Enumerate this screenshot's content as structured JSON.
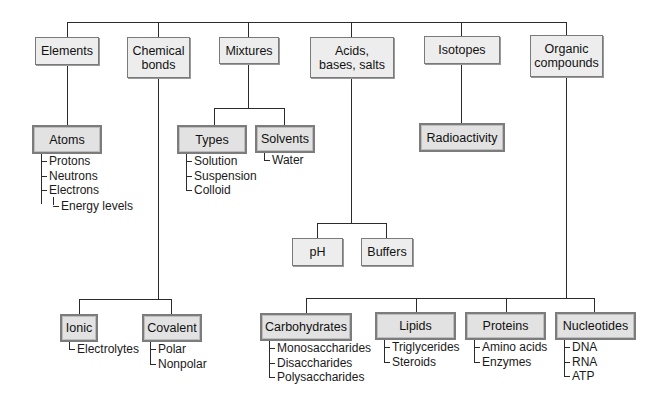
{
  "diagram": {
    "top_level": [
      {
        "label": "Elements"
      },
      {
        "label": "Chemical bonds"
      },
      {
        "label": "Mixtures"
      },
      {
        "label": "Acids, bases, salts"
      },
      {
        "label": "Isotopes"
      },
      {
        "label": "Organic compounds"
      }
    ],
    "elements": {
      "child": "Atoms",
      "items": [
        "Protons",
        "Neutrons",
        "Electrons"
      ],
      "subitem": "Energy levels"
    },
    "chemical_bonds": {
      "ionic": {
        "label": "Ionic",
        "items": [
          "Electrolytes"
        ]
      },
      "covalent": {
        "label": "Covalent",
        "items": [
          "Polar",
          "Nonpolar"
        ]
      }
    },
    "mixtures": {
      "types": {
        "label": "Types",
        "items": [
          "Solution",
          "Suspension",
          "Colloid"
        ]
      },
      "solvents": {
        "label": "Solvents",
        "items": [
          "Water"
        ]
      }
    },
    "acids": {
      "children": [
        "pH",
        "Buffers"
      ]
    },
    "isotopes": {
      "child": "Radioactivity"
    },
    "organic": {
      "carbohydrates": {
        "label": "Carbohydrates",
        "items": [
          "Monosaccharides",
          "Disaccharides",
          "Polysaccharides"
        ]
      },
      "lipids": {
        "label": "Lipids",
        "items": [
          "Triglycerides",
          "Steroids"
        ]
      },
      "proteins": {
        "label": "Proteins",
        "items": [
          "Amino acids",
          "Enzymes"
        ]
      },
      "nucleotides": {
        "label": "Nucleotides",
        "items": [
          "DNA",
          "RNA",
          "ATP"
        ]
      }
    }
  }
}
